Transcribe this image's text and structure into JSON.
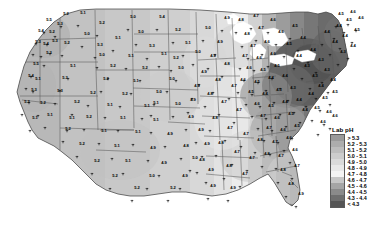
{
  "figure": {
    "kind": "choropleth-map",
    "region": "Contiguous United States",
    "background_color": "#ffffff",
    "border_color": "#4a4a4a"
  },
  "legend": {
    "title": "Lab pH",
    "position": "right",
    "entries": [
      {
        "label": "> 5.3",
        "color": "#9a9a9a",
        "min": 5.3,
        "max": null
      },
      {
        "label": "5.2 - 5.3",
        "color": "#adadad",
        "min": 5.2,
        "max": 5.3
      },
      {
        "label": "5.1 - 5.2",
        "color": "#bdbdbd",
        "min": 5.1,
        "max": 5.2
      },
      {
        "label": "5.0 - 5.1",
        "color": "#cccccc",
        "min": 5.0,
        "max": 5.1
      },
      {
        "label": "4.9 - 5.0",
        "color": "#dadada",
        "min": 4.9,
        "max": 5.0
      },
      {
        "label": "4.8 - 4.9",
        "color": "#e8e8e8",
        "min": 4.8,
        "max": 4.9
      },
      {
        "label": "4.7 - 4.8",
        "color": "#f4f4f4",
        "min": 4.7,
        "max": 4.8
      },
      {
        "label": "4.6 - 4.7",
        "color": "#c6c6c6",
        "min": 4.6,
        "max": 4.7
      },
      {
        "label": "4.5 - 4.6",
        "color": "#a5a5a5",
        "min": 4.5,
        "max": 4.6
      },
      {
        "label": "4.4 - 4.5",
        "color": "#8a8a8a",
        "min": 4.4,
        "max": 4.5
      },
      {
        "label": "4.3 - 4.4",
        "color": "#6e6e6e",
        "min": 4.3,
        "max": 4.4
      },
      {
        "label": "< 4.3",
        "color": "#555555",
        "min": null,
        "max": 4.3
      }
    ]
  },
  "chart_data": {
    "type": "heatmap",
    "title": "Lab pH",
    "xlabel": "",
    "ylabel": "",
    "value_range": [
      4.2,
      5.6
    ],
    "sites": [
      {
        "x": 61,
        "y": 16,
        "value": "5.2"
      },
      {
        "x": 78,
        "y": 15,
        "value": "5.1"
      },
      {
        "x": 44,
        "y": 22,
        "value": "5.5"
      },
      {
        "x": 55,
        "y": 26,
        "value": "5.3"
      },
      {
        "x": 97,
        "y": 25,
        "value": "5.2"
      },
      {
        "x": 128,
        "y": 19,
        "value": "5.0"
      },
      {
        "x": 157,
        "y": 19,
        "value": "5.4"
      },
      {
        "x": 36,
        "y": 33,
        "value": "5.4"
      },
      {
        "x": 47,
        "y": 34,
        "value": "5.2"
      },
      {
        "x": 82,
        "y": 36,
        "value": "5.0"
      },
      {
        "x": 136,
        "y": 34,
        "value": "5.0"
      },
      {
        "x": 173,
        "y": 32,
        "value": "5.2"
      },
      {
        "x": 33,
        "y": 44,
        "value": "5.3"
      },
      {
        "x": 41,
        "y": 46,
        "value": "5.4"
      },
      {
        "x": 50,
        "y": 43,
        "value": "5.3"
      },
      {
        "x": 95,
        "y": 47,
        "value": "5.3"
      },
      {
        "x": 147,
        "y": 48,
        "value": "5.3"
      },
      {
        "x": 183,
        "y": 45,
        "value": "5.1"
      },
      {
        "x": 44,
        "y": 55,
        "value": "5.3"
      },
      {
        "x": 97,
        "y": 57,
        "value": "5.0"
      },
      {
        "x": 126,
        "y": 58,
        "value": "5.1"
      },
      {
        "x": 159,
        "y": 56,
        "value": "5.1"
      },
      {
        "x": 193,
        "y": 54,
        "value": "5.0"
      },
      {
        "x": 31,
        "y": 66,
        "value": "5.5"
      },
      {
        "x": 68,
        "y": 68,
        "value": "5.1"
      },
      {
        "x": 108,
        "y": 68,
        "value": "5.2"
      },
      {
        "x": 140,
        "y": 70,
        "value": "5.2"
      },
      {
        "x": 176,
        "y": 70,
        "value": "5.0"
      },
      {
        "x": 26,
        "y": 78,
        "value": "5.4"
      },
      {
        "x": 33,
        "y": 81,
        "value": "5.1"
      },
      {
        "x": 60,
        "y": 80,
        "value": "5.3"
      },
      {
        "x": 101,
        "y": 81,
        "value": "5.2"
      },
      {
        "x": 131,
        "y": 83,
        "value": "5.1"
      },
      {
        "x": 167,
        "y": 81,
        "value": "5.0"
      },
      {
        "x": 29,
        "y": 92,
        "value": "5.3"
      },
      {
        "x": 55,
        "y": 93,
        "value": "5.3"
      },
      {
        "x": 88,
        "y": 95,
        "value": "5.2"
      },
      {
        "x": 120,
        "y": 96,
        "value": "5.2"
      },
      {
        "x": 154,
        "y": 94,
        "value": "5.0"
      },
      {
        "x": 38,
        "y": 105,
        "value": "5.2"
      },
      {
        "x": 72,
        "y": 104,
        "value": "5.2"
      },
      {
        "x": 105,
        "y": 107,
        "value": "5.1"
      },
      {
        "x": 142,
        "y": 108,
        "value": "5.1"
      },
      {
        "x": 173,
        "y": 106,
        "value": "5.0"
      },
      {
        "x": 45,
        "y": 117,
        "value": "5.1"
      },
      {
        "x": 84,
        "y": 119,
        "value": "5.2"
      },
      {
        "x": 118,
        "y": 120,
        "value": "5.1"
      },
      {
        "x": 151,
        "y": 122,
        "value": "5.1"
      },
      {
        "x": 186,
        "y": 119,
        "value": "4.9"
      },
      {
        "x": 63,
        "y": 131,
        "value": "5.2"
      },
      {
        "x": 99,
        "y": 133,
        "value": "5.1"
      },
      {
        "x": 133,
        "y": 134,
        "value": "5.1"
      },
      {
        "x": 165,
        "y": 136,
        "value": "4.9"
      },
      {
        "x": 77,
        "y": 146,
        "value": "5.2"
      },
      {
        "x": 112,
        "y": 148,
        "value": "5.1"
      },
      {
        "x": 148,
        "y": 150,
        "value": "4.9"
      },
      {
        "x": 181,
        "y": 148,
        "value": "4.8"
      },
      {
        "x": 123,
        "y": 163,
        "value": "5.1"
      },
      {
        "x": 159,
        "y": 165,
        "value": "4.9"
      },
      {
        "x": 197,
        "y": 162,
        "value": "4.8"
      },
      {
        "x": 147,
        "y": 178,
        "value": "5.0"
      },
      {
        "x": 180,
        "y": 178,
        "value": "4.9"
      },
      {
        "x": 203,
        "y": 30,
        "value": "5.0"
      },
      {
        "x": 215,
        "y": 44,
        "value": "4.9"
      },
      {
        "x": 208,
        "y": 58,
        "value": "4.9"
      },
      {
        "x": 222,
        "y": 66,
        "value": "4.8"
      },
      {
        "x": 199,
        "y": 74,
        "value": "4.9"
      },
      {
        "x": 213,
        "y": 82,
        "value": "4.8"
      },
      {
        "x": 229,
        "y": 88,
        "value": "4.7"
      },
      {
        "x": 205,
        "y": 96,
        "value": "4.8"
      },
      {
        "x": 219,
        "y": 104,
        "value": "4.7"
      },
      {
        "x": 234,
        "y": 112,
        "value": "4.7"
      },
      {
        "x": 210,
        "y": 120,
        "value": "4.8"
      },
      {
        "x": 225,
        "y": 130,
        "value": "4.7"
      },
      {
        "x": 241,
        "y": 136,
        "value": "4.7"
      },
      {
        "x": 216,
        "y": 145,
        "value": "4.8"
      },
      {
        "x": 232,
        "y": 154,
        "value": "4.7"
      },
      {
        "x": 247,
        "y": 160,
        "value": "4.7"
      },
      {
        "x": 224,
        "y": 168,
        "value": "4.8"
      },
      {
        "x": 240,
        "y": 176,
        "value": "4.7"
      },
      {
        "x": 242,
        "y": 36,
        "value": "4.8"
      },
      {
        "x": 256,
        "y": 30,
        "value": "4.7"
      },
      {
        "x": 248,
        "y": 48,
        "value": "4.7"
      },
      {
        "x": 262,
        "y": 44,
        "value": "4.6"
      },
      {
        "x": 240,
        "y": 58,
        "value": "4.7"
      },
      {
        "x": 254,
        "y": 60,
        "value": "4.6"
      },
      {
        "x": 268,
        "y": 56,
        "value": "4.6"
      },
      {
        "x": 244,
        "y": 70,
        "value": "4.6"
      },
      {
        "x": 258,
        "y": 72,
        "value": "4.5"
      },
      {
        "x": 272,
        "y": 68,
        "value": "4.5"
      },
      {
        "x": 238,
        "y": 82,
        "value": "4.6"
      },
      {
        "x": 252,
        "y": 84,
        "value": "4.5"
      },
      {
        "x": 266,
        "y": 80,
        "value": "4.4"
      },
      {
        "x": 280,
        "y": 78,
        "value": "4.4"
      },
      {
        "x": 246,
        "y": 94,
        "value": "4.5"
      },
      {
        "x": 260,
        "y": 96,
        "value": "4.4"
      },
      {
        "x": 274,
        "y": 92,
        "value": "4.3"
      },
      {
        "x": 288,
        "y": 90,
        "value": "4.3"
      },
      {
        "x": 252,
        "y": 106,
        "value": "4.6"
      },
      {
        "x": 266,
        "y": 108,
        "value": "4.5"
      },
      {
        "x": 280,
        "y": 104,
        "value": "4.4"
      },
      {
        "x": 294,
        "y": 102,
        "value": "4.4"
      },
      {
        "x": 258,
        "y": 118,
        "value": "4.7"
      },
      {
        "x": 272,
        "y": 120,
        "value": "4.6"
      },
      {
        "x": 286,
        "y": 116,
        "value": "4.5"
      },
      {
        "x": 300,
        "y": 112,
        "value": "4.4"
      },
      {
        "x": 264,
        "y": 130,
        "value": "4.7"
      },
      {
        "x": 278,
        "y": 132,
        "value": "4.6"
      },
      {
        "x": 292,
        "y": 128,
        "value": "4.5"
      },
      {
        "x": 255,
        "y": 142,
        "value": "4.8"
      },
      {
        "x": 270,
        "y": 144,
        "value": "4.7"
      },
      {
        "x": 284,
        "y": 140,
        "value": "4.6"
      },
      {
        "x": 262,
        "y": 156,
        "value": "4.8"
      },
      {
        "x": 276,
        "y": 158,
        "value": "4.7"
      },
      {
        "x": 290,
        "y": 152,
        "value": "4.6"
      },
      {
        "x": 278,
        "y": 172,
        "value": "4.8"
      },
      {
        "x": 292,
        "y": 168,
        "value": "4.7"
      },
      {
        "x": 286,
        "y": 186,
        "value": "4.8"
      },
      {
        "x": 296,
        "y": 196,
        "value": "4.9"
      },
      {
        "x": 276,
        "y": 34,
        "value": "4.6"
      },
      {
        "x": 290,
        "y": 28,
        "value": "4.5"
      },
      {
        "x": 284,
        "y": 46,
        "value": "4.5"
      },
      {
        "x": 298,
        "y": 40,
        "value": "4.4"
      },
      {
        "x": 294,
        "y": 58,
        "value": "4.4"
      },
      {
        "x": 308,
        "y": 52,
        "value": "4.4"
      },
      {
        "x": 302,
        "y": 68,
        "value": "4.3"
      },
      {
        "x": 316,
        "y": 62,
        "value": "4.3"
      },
      {
        "x": 310,
        "y": 78,
        "value": "4.3"
      },
      {
        "x": 322,
        "y": 72,
        "value": "4.3"
      },
      {
        "x": 316,
        "y": 88,
        "value": "4.4"
      },
      {
        "x": 328,
        "y": 82,
        "value": "4.4"
      },
      {
        "x": 306,
        "y": 96,
        "value": "4.4"
      },
      {
        "x": 320,
        "y": 100,
        "value": "4.5"
      },
      {
        "x": 330,
        "y": 94,
        "value": "4.5"
      },
      {
        "x": 312,
        "y": 110,
        "value": "4.5"
      },
      {
        "x": 324,
        "y": 114,
        "value": "4.6"
      },
      {
        "x": 318,
        "y": 124,
        "value": "4.6"
      },
      {
        "x": 330,
        "y": 118,
        "value": "4.6"
      },
      {
        "x": 322,
        "y": 34,
        "value": "4.4"
      },
      {
        "x": 334,
        "y": 28,
        "value": "4.4"
      },
      {
        "x": 330,
        "y": 44,
        "value": "4.4"
      },
      {
        "x": 340,
        "y": 38,
        "value": "4.4"
      },
      {
        "x": 338,
        "y": 54,
        "value": "4.3"
      },
      {
        "x": 348,
        "y": 48,
        "value": "4.4"
      },
      {
        "x": 344,
        "y": 22,
        "value": "4.5"
      },
      {
        "x": 352,
        "y": 32,
        "value": "4.5"
      },
      {
        "x": 356,
        "y": 20,
        "value": "4.6"
      },
      {
        "x": 348,
        "y": 14,
        "value": "4.6"
      },
      {
        "x": 336,
        "y": 16,
        "value": "4.5"
      },
      {
        "x": 192,
        "y": 88,
        "value": "4.9"
      },
      {
        "x": 188,
        "y": 102,
        "value": "4.9"
      },
      {
        "x": 196,
        "y": 132,
        "value": "4.9"
      },
      {
        "x": 202,
        "y": 146,
        "value": "4.9"
      },
      {
        "x": 190,
        "y": 160,
        "value": "5.0"
      },
      {
        "x": 206,
        "y": 172,
        "value": "4.9"
      },
      {
        "x": 168,
        "y": 190,
        "value": "5.2"
      },
      {
        "x": 132,
        "y": 190,
        "value": "5.2"
      },
      {
        "x": 110,
        "y": 178,
        "value": "5.2"
      },
      {
        "x": 92,
        "y": 163,
        "value": "5.2"
      },
      {
        "x": 67,
        "y": 120,
        "value": "5.1"
      },
      {
        "x": 22,
        "y": 104,
        "value": "5.2"
      },
      {
        "x": 30,
        "y": 120,
        "value": "5.1"
      },
      {
        "x": 62,
        "y": 45,
        "value": "5.2"
      },
      {
        "x": 113,
        "y": 40,
        "value": "5.1"
      },
      {
        "x": 171,
        "y": 60,
        "value": "5.2"
      },
      {
        "x": 151,
        "y": 105,
        "value": "5.1"
      },
      {
        "x": 222,
        "y": 20,
        "value": "4.9"
      },
      {
        "x": 236,
        "y": 22,
        "value": "4.8"
      },
      {
        "x": 251,
        "y": 18,
        "value": "4.7"
      },
      {
        "x": 268,
        "y": 22,
        "value": "4.6"
      },
      {
        "x": 208,
        "y": 188,
        "value": "4.9"
      },
      {
        "x": 228,
        "y": 190,
        "value": "4.9"
      }
    ]
  }
}
